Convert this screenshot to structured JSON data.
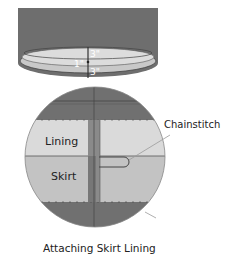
{
  "diagram": {
    "caption": "Attaching Skirt Lining",
    "drum": {
      "labels": {
        "seam_allowance_top": "3\"",
        "seam_allowance_bottom": "3\"",
        "gap": "1\""
      }
    },
    "detail": {
      "labels": {
        "lining": "Lining",
        "skirt": "Skirt",
        "chainstitch": "Chainstitch"
      }
    },
    "colors": {
      "dark_fabric": "#6e6e6e",
      "lining": "#d9d9d9",
      "skirt": "#c2c2c2",
      "strip": "#8a8a8a",
      "outline": "#444444",
      "text": "#222222",
      "leader": "#9a9a9a"
    }
  }
}
